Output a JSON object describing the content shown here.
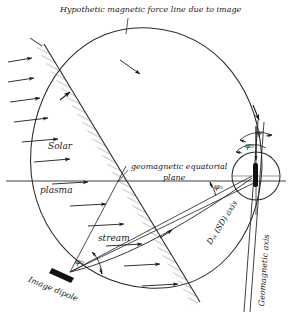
{
  "figure": {
    "title": "Hypothetic magnetic force line due to image",
    "type": "schematic-diagram"
  },
  "labels": {
    "title": "Hypothetic magnetic force line due to image",
    "solar": "Solar",
    "plasma": "plasma",
    "stream": "stream",
    "equatorial_plane_line1": "geomagnetic equatorial",
    "equatorial_plane_line2": "plane",
    "image_dipole": "Image dipole",
    "dst_axis": "Dₛₜ (SD) axis",
    "geomagnetic_axis": "Geomagnetic axis"
  },
  "angles": {
    "psi": "ψ",
    "phi_top": "φ₅",
    "phi_mid": "φ₅",
    "phi_bottom": "φ₅"
  },
  "colors": {
    "ink": "#1a1a1a",
    "line": "#2b2b2b",
    "hatch": "#555555",
    "background": "#ffffff"
  },
  "elements": {
    "earth_circle": "earth-circle",
    "dipole_bar": "earth-dipole-bar",
    "image_dipole_bar": "image-dipole-bar",
    "boundary_hatched": "magnetopause-boundary",
    "force_line_oval": "hypothetic-force-line",
    "solar_wind_arrows": "solar-wind-arrows"
  }
}
